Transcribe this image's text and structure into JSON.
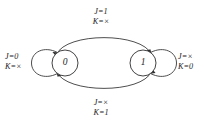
{
  "diagram": {
    "type": "state-transition-diagram",
    "background_color": "#ffffff",
    "line_color": "#2e2e2e",
    "text_color": "#1c1c1c",
    "states": [
      {
        "id": "state-0",
        "label": "0",
        "cx": 65,
        "cy": 63,
        "r": 13
      },
      {
        "id": "state-1",
        "label": "1",
        "cx": 143,
        "cy": 63,
        "r": 13
      }
    ],
    "transitions": [
      {
        "id": "transition-0-to-1",
        "from": "0",
        "to": "1",
        "kind": "arc-top",
        "label_line1": "J=1",
        "label_line2": "K=×"
      },
      {
        "id": "transition-1-to-0",
        "from": "1",
        "to": "0",
        "kind": "arc-bottom",
        "label_line1": "J=×",
        "label_line2": "K=1"
      },
      {
        "id": "transition-0-to-0",
        "from": "0",
        "to": "0",
        "kind": "self-loop-left",
        "label_line1": "J=0",
        "label_line2": "K=×"
      },
      {
        "id": "transition-1-to-1",
        "from": "1",
        "to": "1",
        "kind": "self-loop-right",
        "label_line1": "J=×",
        "label_line2": "K=0"
      }
    ]
  }
}
